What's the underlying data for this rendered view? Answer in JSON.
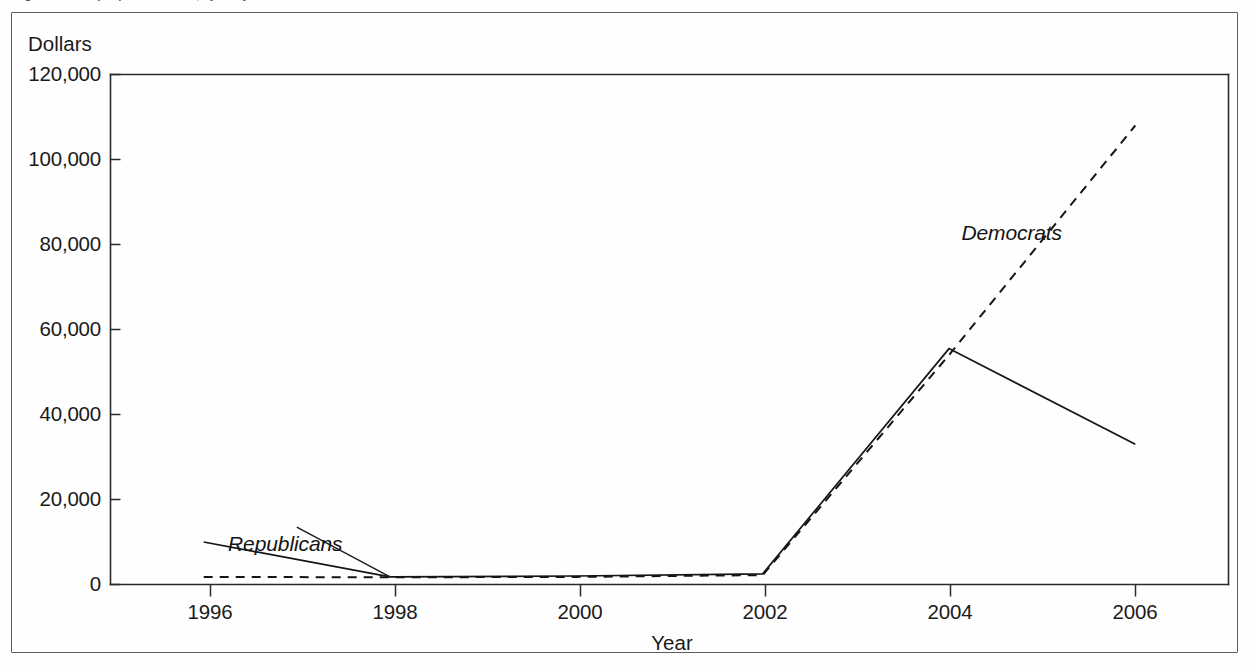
{
  "figure": {
    "caption": "Figure 2.  Receipts per Candidate, by Party"
  },
  "chart_data": {
    "type": "line",
    "title": "",
    "xlabel": "Year",
    "ylabel": "Dollars",
    "x": [
      1996,
      1998,
      2000,
      2002,
      2004,
      2006
    ],
    "xlim": [
      1995,
      2007
    ],
    "ylim": [
      0,
      120000
    ],
    "grid": false,
    "legend_position": "inline-annotation",
    "x_tick_labels": [
      "1996",
      "1998",
      "2000",
      "2002",
      "2004",
      "2006"
    ],
    "y_tick_labels": [
      "0",
      "20,000",
      "40,000",
      "60,000",
      "80,000",
      "100,000",
      "120,000"
    ],
    "y_ticks": [
      0,
      20000,
      40000,
      60000,
      80000,
      100000,
      120000
    ],
    "series": [
      {
        "name": "Republicans",
        "style": "solid",
        "values": [
          10000,
          1800,
          2000,
          2500,
          55500,
          33000
        ]
      },
      {
        "name": "Democrats",
        "style": "dashed",
        "values": [
          1800,
          1700,
          1800,
          2200,
          54000,
          108000
        ]
      }
    ],
    "annotations": [
      {
        "text": "Republicans",
        "x": 1997.0,
        "y": 13500
      },
      {
        "text": "Democrats",
        "x": 2004.6,
        "y": 83000
      }
    ]
  },
  "colors": {
    "ink": "#151515",
    "frame": "#5d5d5d",
    "paper": "#fefefe"
  }
}
